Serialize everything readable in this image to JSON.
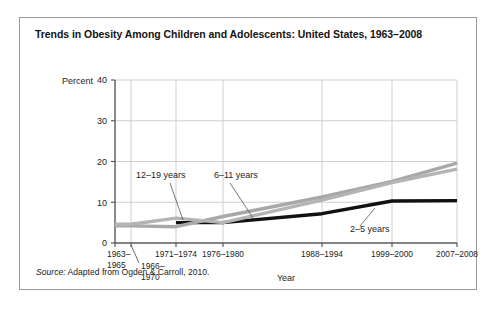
{
  "figure": {
    "title": "Trends in Obesity Among Children and Adolescents: United States, 1963–2008",
    "source_label": "Source:",
    "source_text": " Adapted from Ogden & Carroll, 2010."
  },
  "chart_data": {
    "type": "line",
    "title": "Trends in Obesity Among Children and Adolescents: United States, 1963–2008",
    "xlabel": "Year",
    "ylabel": "Percent",
    "ylim": [
      0,
      40
    ],
    "yticks": [
      0,
      10,
      20,
      30,
      40
    ],
    "ytick_labels": [
      "0",
      "10",
      "20",
      "30",
      "40"
    ],
    "grid": true,
    "legend": "inline-annotations",
    "categories": [
      "1963–1965",
      "1966–1970",
      "1971–1974",
      "1976–1980",
      "1988–1994",
      "1999–2000",
      "2007–2008"
    ],
    "category_lines": [
      [
        "1963–",
        "1965"
      ],
      [
        "1966–",
        "1970"
      ],
      [
        "1971–1974"
      ],
      [
        "1976–1980"
      ],
      [
        "1988–1994"
      ],
      [
        "1999–2000"
      ],
      [
        "2007–2008"
      ]
    ],
    "series": [
      {
        "name": "2–5 years",
        "color": "#111111",
        "width": 3.4,
        "values": [
          null,
          null,
          5.0,
          5.0,
          7.2,
          10.3,
          10.4
        ]
      },
      {
        "name": "6–11 years",
        "color": "#a8a8a8",
        "width": 3.4,
        "values": [
          4.2,
          4.2,
          4.0,
          6.5,
          11.3,
          15.1,
          19.6
        ]
      },
      {
        "name": "12–19 years",
        "color": "#b4b4b4",
        "width": 3.4,
        "values": [
          4.6,
          4.6,
          6.1,
          5.0,
          10.5,
          14.8,
          18.1
        ]
      }
    ],
    "annotations": [
      {
        "text": "12–19 years",
        "label_x": 116,
        "label_y": 160,
        "anchor": "start",
        "leader_from": [
          150,
          165
        ],
        "leader_to": [
          163,
          202
        ]
      },
      {
        "text": "6–11 years",
        "label_x": 194,
        "label_y": 160,
        "anchor": "start",
        "leader_from": [
          210,
          165
        ],
        "leader_to": [
          233,
          200
        ]
      },
      {
        "text": "2–5 years",
        "label_x": 330,
        "label_y": 214,
        "anchor": "start",
        "leader_from": [
          340,
          208
        ],
        "leader_to": [
          355,
          190
        ]
      }
    ]
  },
  "geometry": {
    "plot_left": 95,
    "plot_right": 437,
    "plot_top": 62,
    "plot_bottom": 225,
    "xpos": [
      95,
      111,
      156,
      203,
      302,
      372,
      437
    ]
  }
}
